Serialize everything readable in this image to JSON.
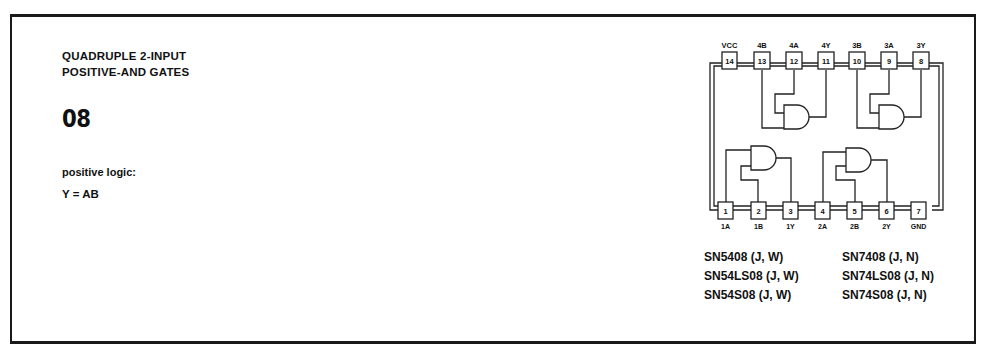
{
  "header": {
    "title_line1": "QUADRUPLE 2-INPUT",
    "title_line2": "POSITIVE-AND GATES",
    "part_number": "08"
  },
  "logic": {
    "label": "positive logic:",
    "equation": "Y = AB"
  },
  "pinout": {
    "top_pins": [
      {
        "number": "14",
        "label": "VCC"
      },
      {
        "number": "13",
        "label": "4B"
      },
      {
        "number": "12",
        "label": "4A"
      },
      {
        "number": "11",
        "label": "4Y"
      },
      {
        "number": "10",
        "label": "3B"
      },
      {
        "number": "9",
        "label": "3A"
      },
      {
        "number": "8",
        "label": "3Y"
      }
    ],
    "bottom_pins": [
      {
        "number": "1",
        "label": "1A"
      },
      {
        "number": "2",
        "label": "1B"
      },
      {
        "number": "3",
        "label": "1Y"
      },
      {
        "number": "4",
        "label": "2A"
      },
      {
        "number": "5",
        "label": "2B"
      },
      {
        "number": "6",
        "label": "2Y"
      },
      {
        "number": "7",
        "label": "GND"
      }
    ]
  },
  "packages": {
    "military": [
      "SN5408 (J, W)",
      "SN54LS08 (J, W)",
      "SN54S08 (J, W)"
    ],
    "commercial": [
      "SN7408 (J, N)",
      "SN74LS08 (J, N)",
      "SN74S08 (J, N)"
    ]
  }
}
